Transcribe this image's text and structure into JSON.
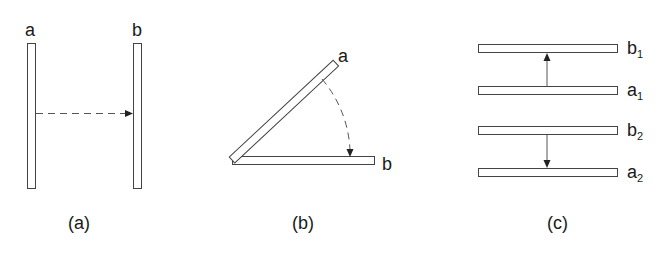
{
  "panels": {
    "a": {
      "caption": "(a)",
      "labels": {
        "left": "a",
        "right": "b"
      },
      "description": "Two vertical plates a and b with a dashed arrow from a to b (translation)"
    },
    "b": {
      "caption": "(b)",
      "labels": {
        "rotated": "a",
        "base": "b"
      },
      "description": "Plate a rotates about a hinge onto plate b along a dashed arc arrow"
    },
    "c": {
      "caption": "(c)",
      "labels": {
        "b1": {
          "base": "b",
          "sub": "1"
        },
        "a1": {
          "base": "a",
          "sub": "1"
        },
        "b2": {
          "base": "b",
          "sub": "2"
        },
        "a2": {
          "base": "a",
          "sub": "2"
        }
      },
      "description": "Four horizontal plates; arrow from a1 up to b1, arrow from b2 down to a2"
    }
  },
  "colors": {
    "stroke": "#444444",
    "text": "#1a1a1a",
    "background": "#ffffff"
  }
}
